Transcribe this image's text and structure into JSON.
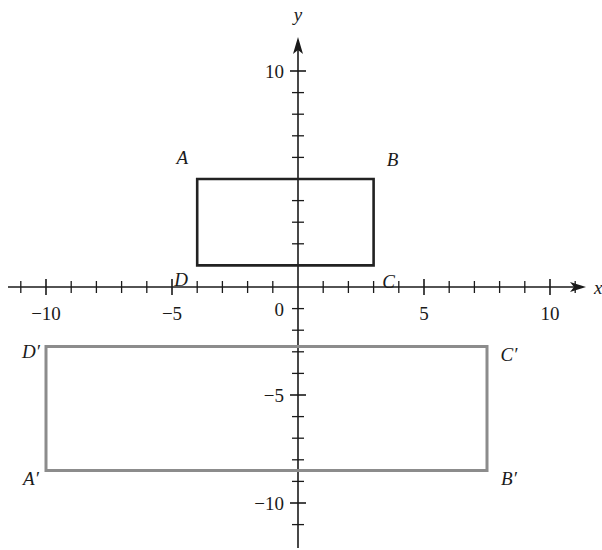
{
  "chart_data": {
    "type": "scatter",
    "subtype": "coordinate-plane-rectangles",
    "title": "",
    "xlabel": "x",
    "ylabel": "y",
    "xlim": [
      -11,
      11
    ],
    "ylim": [
      -11,
      10.5
    ],
    "grid": false,
    "legend": null,
    "x_tick_step": 1,
    "y_tick_step": 1,
    "x_tick_labels": [
      {
        "value": -10,
        "label": "−10"
      },
      {
        "value": -5,
        "label": "−5"
      },
      {
        "value": 0,
        "label": "0"
      },
      {
        "value": 5,
        "label": "5"
      },
      {
        "value": 10,
        "label": "10"
      }
    ],
    "y_tick_labels": [
      {
        "value": 10,
        "label": "10"
      },
      {
        "value": -5,
        "label": "−5"
      },
      {
        "value": -10,
        "label": "−10"
      }
    ],
    "series": [
      {
        "name": "ABCD",
        "color": "#222222",
        "points": [
          {
            "label": "A",
            "x": -4,
            "y": 5
          },
          {
            "label": "B",
            "x": 3,
            "y": 5
          },
          {
            "label": "C",
            "x": 3,
            "y": 1
          },
          {
            "label": "D",
            "x": -4,
            "y": 1
          }
        ]
      },
      {
        "name": "A'B'C'D'",
        "color": "#8c8c8c",
        "points": [
          {
            "label": "A′",
            "x": -10,
            "y": -8.5
          },
          {
            "label": "B′",
            "x": 7.5,
            "y": -8.5
          },
          {
            "label": "C′",
            "x": 7.5,
            "y": -2.75
          },
          {
            "label": "D′",
            "x": -10,
            "y": -2.75
          }
        ]
      }
    ]
  },
  "axes": {
    "x_name": "x",
    "y_name": "y"
  }
}
